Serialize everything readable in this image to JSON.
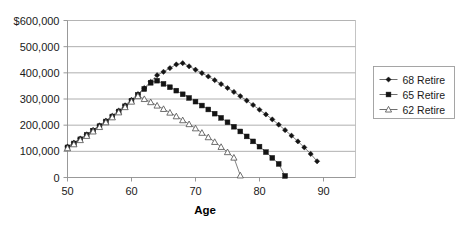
{
  "chart_data": {
    "type": "line",
    "title": "",
    "xlabel": "Age",
    "ylabel": "",
    "xlim": [
      50,
      95
    ],
    "ylim": [
      0,
      600000
    ],
    "xticks": [
      50,
      60,
      70,
      80,
      90
    ],
    "yticks": [
      0,
      100000,
      200000,
      300000,
      400000,
      500000,
      600000
    ],
    "xticklabels": [
      "50",
      "60",
      "70",
      "80",
      "90"
    ],
    "yticklabels": [
      "0",
      "100,000",
      "200,000",
      "300,000",
      "400,000",
      "500,000",
      "$600,000"
    ],
    "grid": true,
    "legend_position": "right",
    "marker_color": "#1a1a1a",
    "line_color": "#4a4a4a",
    "grid_color": "#9a9a9a",
    "series": [
      {
        "name": "68 Retire",
        "marker": "diamond",
        "filled": true,
        "x": [
          50,
          51,
          52,
          53,
          54,
          55,
          56,
          57,
          58,
          59,
          60,
          61,
          62,
          63,
          64,
          65,
          66,
          67,
          68,
          69,
          70,
          71,
          72,
          73,
          74,
          75,
          76,
          77,
          78,
          79,
          80,
          81,
          82,
          83,
          84,
          85,
          86,
          87,
          88,
          89
        ],
        "y": [
          118000,
          133000,
          149000,
          165000,
          182000,
          199000,
          217000,
          236000,
          256000,
          276000,
          297000,
          319000,
          342000,
          366000,
          391000,
          404000,
          418000,
          432000,
          437000,
          425000,
          412000,
          399000,
          386000,
          372000,
          357000,
          342000,
          327000,
          311000,
          294000,
          277000,
          259000,
          241000,
          222000,
          202000,
          181000,
          160000,
          138000,
          115000,
          90000,
          62000
        ]
      },
      {
        "name": "65 Retire",
        "marker": "square",
        "filled": true,
        "x": [
          50,
          51,
          52,
          53,
          54,
          55,
          56,
          57,
          58,
          59,
          60,
          61,
          62,
          63,
          64,
          65,
          66,
          67,
          68,
          69,
          70,
          71,
          72,
          73,
          74,
          75,
          76,
          77,
          78,
          79,
          80,
          81,
          82,
          83,
          84
        ],
        "y": [
          115000,
          130000,
          146000,
          162000,
          179000,
          196000,
          214000,
          233000,
          252000,
          272000,
          293000,
          315000,
          338000,
          362000,
          370000,
          358000,
          345000,
          332000,
          318000,
          304000,
          290000,
          275000,
          260000,
          244000,
          228000,
          211000,
          194000,
          176000,
          157000,
          138000,
          118000,
          97000,
          75000,
          52000,
          6000
        ]
      },
      {
        "name": "62 Retire",
        "marker": "triangle",
        "filled": false,
        "x": [
          50,
          51,
          52,
          53,
          54,
          55,
          56,
          57,
          58,
          59,
          60,
          61,
          62,
          63,
          64,
          65,
          66,
          67,
          68,
          69,
          70,
          71,
          72,
          73,
          74,
          75,
          76,
          77
        ],
        "y": [
          112000,
          127000,
          143000,
          159000,
          176000,
          193000,
          211000,
          230000,
          249000,
          269000,
          290000,
          311000,
          300000,
          288000,
          275000,
          262000,
          248000,
          234000,
          219000,
          204000,
          188000,
          171000,
          154000,
          136000,
          117000,
          97000,
          76000,
          8000
        ]
      }
    ]
  },
  "legend": {
    "entries": [
      {
        "label": "68 Retire"
      },
      {
        "label": "65 Retire"
      },
      {
        "label": "62 Retire"
      }
    ]
  }
}
